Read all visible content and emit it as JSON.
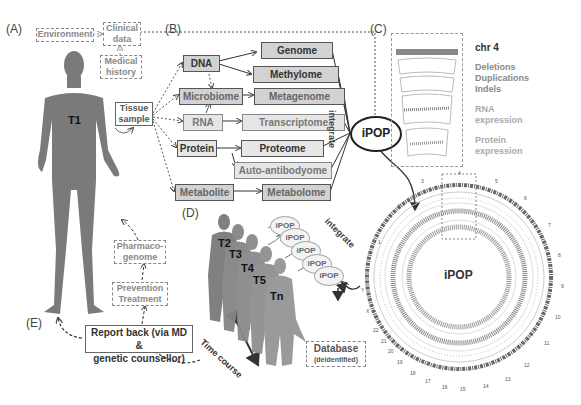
{
  "panels": {
    "A": "(A)",
    "B": "(B)",
    "C": "(C)",
    "D": "(D)",
    "E": "(E)"
  },
  "panel_a": {
    "environment": "Environment",
    "clinical_data": [
      "Clinical",
      "data"
    ],
    "medical_history": [
      "Medical",
      "history"
    ],
    "person_label": "T1",
    "tissue_sample": [
      "Tissue",
      "sample"
    ]
  },
  "panel_b": {
    "sources": [
      "DNA",
      "Microbiome",
      "RNA",
      "Protein",
      "Metabolite"
    ],
    "omes": [
      "Genome",
      "Methylome",
      "Metagenome",
      "Transcriptome",
      "Proteome",
      "Auto-antibodyome",
      "Metabolome"
    ],
    "integrate_label": "integrate",
    "ipop": "iPOP"
  },
  "panel_c": {
    "chr_title": "chr 4",
    "tracks": [
      "Deletions",
      "Duplications",
      "Indels",
      "RNA",
      "expression",
      "Protein",
      "expression"
    ],
    "circos_center": "iPOP",
    "chromosomes": [
      "1",
      "2",
      "3",
      "4",
      "5",
      "6",
      "7",
      "8",
      "9",
      "10",
      "11",
      "12",
      "13",
      "14",
      "15",
      "16",
      "17",
      "18",
      "19",
      "20",
      "21",
      "22",
      "X",
      "Y"
    ]
  },
  "panel_d": {
    "timepoints": [
      "T2",
      "T3",
      "T4",
      "T5",
      "Tn"
    ],
    "ipop_bubbles": [
      "iPOP",
      "iPOP",
      "iPOP",
      "iPOP",
      "iPOP"
    ],
    "integrate_label": "integrate",
    "time_course": "Time course",
    "database": "Database",
    "database_sub": "(deidentified)"
  },
  "panel_e": {
    "report_back": [
      "Report back (via MD &",
      "genetic counsellor)"
    ],
    "prevention": [
      "Prevention",
      "Treatment"
    ],
    "pharmacogenome": [
      "Pharmaco-",
      "genome"
    ]
  }
}
